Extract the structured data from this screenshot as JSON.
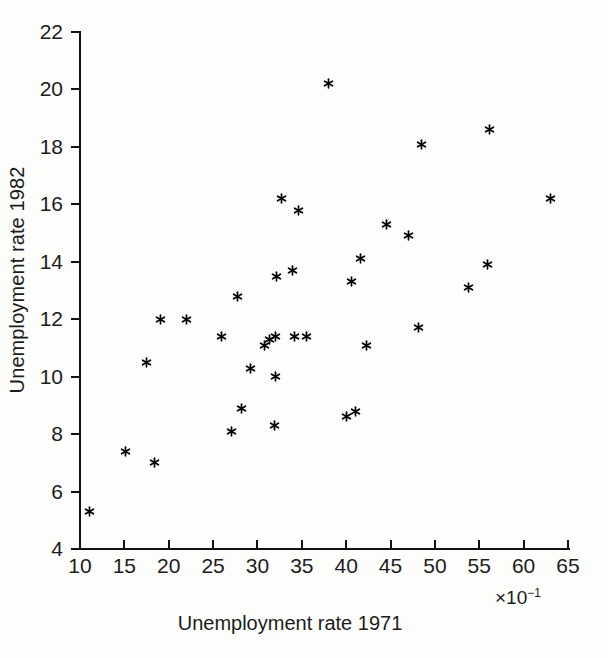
{
  "chart_data": {
    "type": "scatter",
    "title": "",
    "xlabel": "Unemployment rate 1971",
    "ylabel": "Unemployment rate 1982",
    "x_exponent_label": "×10",
    "x_exponent_sup": "−1",
    "xlim": [
      10,
      65
    ],
    "ylim": [
      4,
      22
    ],
    "xticks": [
      10,
      15,
      20,
      25,
      30,
      35,
      40,
      45,
      50,
      55,
      60,
      65
    ],
    "yticks": [
      4,
      6,
      8,
      10,
      12,
      14,
      16,
      18,
      20,
      22
    ],
    "xtick_labels": [
      "10",
      "15",
      "20",
      "25",
      "30",
      "35",
      "40",
      "45",
      "50",
      "55",
      "60",
      "65"
    ],
    "ytick_labels": [
      "4",
      "6",
      "8",
      "10",
      "12",
      "14",
      "16",
      "18",
      "20",
      "22"
    ],
    "grid": false,
    "legend": null,
    "marker": "asterisk",
    "marker_color": "#000000",
    "background_color": "#fdfdfc",
    "axis_color": "#111111",
    "points": [
      {
        "x": 11.1,
        "y": 5.3
      },
      {
        "x": 15.1,
        "y": 7.4
      },
      {
        "x": 17.5,
        "y": 10.5
      },
      {
        "x": 18.4,
        "y": 7.0
      },
      {
        "x": 19.1,
        "y": 12.0
      },
      {
        "x": 22.0,
        "y": 12.0
      },
      {
        "x": 26.0,
        "y": 11.4
      },
      {
        "x": 27.1,
        "y": 8.1
      },
      {
        "x": 27.8,
        "y": 12.8
      },
      {
        "x": 28.2,
        "y": 8.9
      },
      {
        "x": 29.2,
        "y": 10.3
      },
      {
        "x": 30.8,
        "y": 11.1
      },
      {
        "x": 31.4,
        "y": 11.3
      },
      {
        "x": 31.9,
        "y": 8.3
      },
      {
        "x": 32.0,
        "y": 10.0
      },
      {
        "x": 32.0,
        "y": 11.4
      },
      {
        "x": 32.2,
        "y": 13.5
      },
      {
        "x": 32.7,
        "y": 16.2
      },
      {
        "x": 34.0,
        "y": 13.7
      },
      {
        "x": 34.2,
        "y": 11.4
      },
      {
        "x": 34.6,
        "y": 15.8
      },
      {
        "x": 35.5,
        "y": 11.4
      },
      {
        "x": 38.0,
        "y": 20.2
      },
      {
        "x": 40.0,
        "y": 8.6
      },
      {
        "x": 40.6,
        "y": 13.3
      },
      {
        "x": 41.1,
        "y": 8.8
      },
      {
        "x": 41.6,
        "y": 14.1
      },
      {
        "x": 42.3,
        "y": 11.1
      },
      {
        "x": 44.6,
        "y": 15.3
      },
      {
        "x": 47.0,
        "y": 14.9
      },
      {
        "x": 48.2,
        "y": 11.7
      },
      {
        "x": 48.5,
        "y": 18.1
      },
      {
        "x": 53.8,
        "y": 13.1
      },
      {
        "x": 55.9,
        "y": 13.9
      },
      {
        "x": 56.2,
        "y": 18.6
      },
      {
        "x": 63.0,
        "y": 16.2
      }
    ]
  }
}
